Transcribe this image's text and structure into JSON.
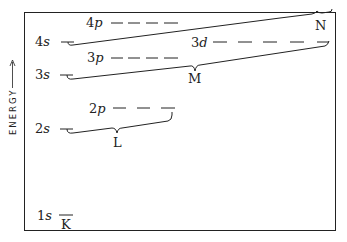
{
  "diagram": {
    "axis_label": "ENERGY",
    "axis_arrow": "up-arrow",
    "levels": [
      {
        "id": "1s",
        "num": "1",
        "sub": "s"
      },
      {
        "id": "2s",
        "num": "2",
        "sub": "s"
      },
      {
        "id": "2p",
        "num": "2",
        "sub": "p"
      },
      {
        "id": "3s",
        "num": "3",
        "sub": "s"
      },
      {
        "id": "3p",
        "num": "3",
        "sub": "p"
      },
      {
        "id": "3d",
        "num": "3",
        "sub": "d"
      },
      {
        "id": "4s",
        "num": "4",
        "sub": "s"
      },
      {
        "id": "4p",
        "num": "4",
        "sub": "p"
      }
    ],
    "shells": [
      {
        "label": "K",
        "levels": [
          "1s"
        ]
      },
      {
        "label": "L",
        "levels": [
          "2s",
          "2p"
        ]
      },
      {
        "label": "M",
        "levels": [
          "3s",
          "3p",
          "3d"
        ]
      },
      {
        "label": "N",
        "levels": [
          "4s",
          "4p"
        ]
      }
    ]
  }
}
